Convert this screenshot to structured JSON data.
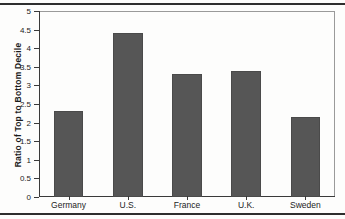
{
  "chart_data": {
    "type": "bar",
    "title": "",
    "xlabel": "",
    "ylabel": "Ratio of Top to Bottom Decile",
    "categories": [
      "Germany",
      "U.S.",
      "France",
      "U.K.",
      "Sweden"
    ],
    "values": [
      2.3,
      4.4,
      3.3,
      3.4,
      2.15
    ],
    "ylim": [
      0,
      5
    ],
    "ytick_labels": [
      "0",
      "0.5",
      "1",
      "1.5",
      "2",
      "2.5",
      "3",
      "3.5",
      "4",
      "4.5",
      "5"
    ],
    "ytick_values": [
      0,
      0.5,
      1,
      1.5,
      2,
      2.5,
      3,
      3.5,
      4,
      4.5,
      5
    ],
    "grid": false,
    "legend": false,
    "legend_position": "none",
    "bar_color": "#565656",
    "axis_color": "#3a3a3a",
    "frame_color": "#9a9a9a",
    "background_color": "#fdfdfc"
  }
}
